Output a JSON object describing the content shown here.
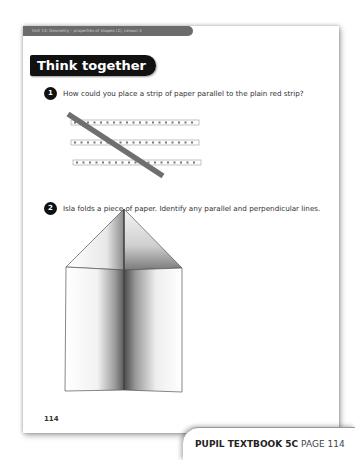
{
  "page": {
    "unit_header": "Unit 14: Geometry – properties of shapes (2), Lesson 3",
    "section_title": "Think together",
    "page_number": "114"
  },
  "questions": [
    {
      "number": "1",
      "text": "How could you place a strip of paper parallel to the plain red strip?",
      "figure": "three-dotted-strips-crossed-by-plain-diagonal-strip",
      "dots_per_strip": 19
    },
    {
      "number": "2",
      "text": "Isla folds a piece of paper. Identify any parallel and perpendicular lines.",
      "figure": "folded-paper-house-shape"
    }
  ],
  "footer_tab": {
    "book": "PUPIL TEXTBOOK 5C",
    "page": "PAGE 114"
  },
  "colors": {
    "header_bar": "#6b6b6b",
    "title_bg": "#111111",
    "diagonal_strip": "#707070"
  }
}
